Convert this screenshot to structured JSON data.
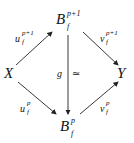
{
  "diagram": {
    "type": "commutative-diagram",
    "nodes": {
      "top": {
        "base": "B",
        "sub": "f",
        "sup": "p+1"
      },
      "left": {
        "base": "X"
      },
      "right": {
        "base": "Y"
      },
      "bottom": {
        "base": "B",
        "sub": "f",
        "sup": "p"
      }
    },
    "arrows": {
      "left_top": {
        "base": "u",
        "sub": "f",
        "sup": "p+1"
      },
      "top_right": {
        "base": "v",
        "sub": "f",
        "sup": "p+1"
      },
      "left_bottom": {
        "base": "u",
        "sub": "f",
        "sup": "p"
      },
      "bottom_right": {
        "base": "v",
        "sub": "f",
        "sup": "p"
      },
      "top_bottom": {
        "label": "g",
        "equiv": "≃"
      }
    }
  }
}
